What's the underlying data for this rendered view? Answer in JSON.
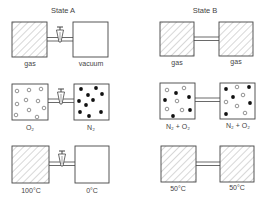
{
  "columns": [
    {
      "title": "State A"
    },
    {
      "title": "State B"
    }
  ],
  "rows": [
    {
      "state_a": {
        "left_label": "gas",
        "right_label": "vacuum",
        "left_fill": "hatched",
        "right_fill": "empty",
        "connector": "valve"
      },
      "state_b": {
        "left_label": "gas",
        "right_label": "gas",
        "left_fill": "hatched",
        "right_fill": "hatched",
        "connector": "open-tube"
      }
    },
    {
      "state_a": {
        "left_label": "O₂",
        "right_label": "N₂",
        "left_fill": "open-circles",
        "right_fill": "filled-dots",
        "connector": "valve"
      },
      "state_b": {
        "left_label": "N₂ + O₂",
        "right_label": "N₂ + O₂",
        "left_fill": "mixed",
        "right_fill": "mixed",
        "connector": "open-tube"
      }
    },
    {
      "state_a": {
        "left_label": "100°C",
        "right_label": "0°C",
        "left_fill": "hatched",
        "right_fill": "empty",
        "connector": "valve"
      },
      "state_b": {
        "left_label": "50°C",
        "right_label": "50°C",
        "left_fill": "hatched",
        "right_fill": "hatched",
        "connector": "open-tube"
      }
    }
  ],
  "colors": {
    "line": "#444444",
    "hatch": "#9a9a9a",
    "dot": "#111111"
  }
}
